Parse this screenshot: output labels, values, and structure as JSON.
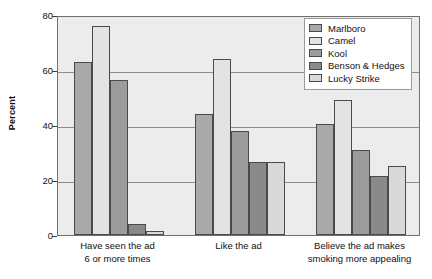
{
  "chart_data": {
    "type": "bar",
    "title": "",
    "xlabel": "",
    "ylabel": "Percent",
    "ylim": [
      0,
      80
    ],
    "yticks": [
      0,
      20,
      40,
      60,
      80
    ],
    "grid": true,
    "legend_position": "top-right",
    "categories": [
      "Have seen the ad\n6 or more times",
      "Like the ad",
      "Believe the ad makes\nsmoking more appealing"
    ],
    "category_lines": [
      [
        "Have seen the ad",
        "6 or more times"
      ],
      [
        "Like the ad",
        ""
      ],
      [
        "Believe the ad makes",
        "smoking more appealing"
      ]
    ],
    "series": [
      {
        "name": "Marlboro",
        "color": "#a9a9a9",
        "values": [
          63,
          44,
          40.5
        ]
      },
      {
        "name": "Camel",
        "color": "#e3e3e3",
        "values": [
          76,
          64,
          49
        ]
      },
      {
        "name": "Kool",
        "color": "#9c9c9c",
        "values": [
          56.5,
          38,
          31
        ]
      },
      {
        "name": "Benson & Hedges",
        "color": "#8a8a8a",
        "values": [
          4,
          26.5,
          21.5
        ]
      },
      {
        "name": "Lucky Strike",
        "color": "#d9d9d9",
        "values": [
          1.5,
          26.5,
          25
        ]
      }
    ]
  },
  "axis": {
    "y_title": "Percent",
    "tick_labels": [
      "80",
      "60",
      "40",
      "20",
      "0"
    ]
  },
  "legend": {
    "entries": [
      {
        "label": "Marlboro"
      },
      {
        "label": "Camel"
      },
      {
        "label": "Kool"
      },
      {
        "label": "Benson & Hedges"
      },
      {
        "label": "Lucky Strike"
      }
    ]
  },
  "style": {
    "plot_background": "#ececec",
    "frame_color": "#6f6f6f",
    "gridline_color": "#8d8d8d",
    "bar_border": "#4a4a4a",
    "page_background": "#ffffff"
  }
}
